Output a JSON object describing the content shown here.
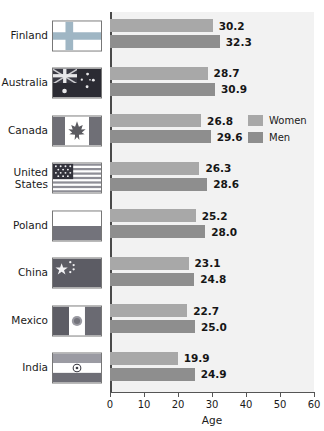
{
  "chart_data": {
    "type": "bar",
    "orientation": "horizontal",
    "title": "",
    "xlabel": "Age",
    "ylabel": "",
    "xlim": [
      0,
      60
    ],
    "xticks": [
      0,
      10,
      20,
      30,
      40,
      50,
      60
    ],
    "grid": false,
    "legend_position": "inside-right",
    "categories": [
      "Finland",
      "Australia",
      "Canada",
      "United States",
      "Poland",
      "China",
      "Mexico",
      "India"
    ],
    "series": [
      {
        "name": "Women",
        "color": "#a8a8a8",
        "values": [
          30.2,
          28.7,
          26.8,
          26.3,
          25.2,
          23.1,
          22.7,
          19.9
        ]
      },
      {
        "name": "Men",
        "color": "#8e8e8e",
        "values": [
          32.3,
          30.9,
          29.6,
          28.6,
          28.0,
          24.8,
          25.0,
          24.9
        ]
      }
    ]
  },
  "legend": {
    "items": [
      {
        "label": "Women",
        "color": "#a8a8a8"
      },
      {
        "label": "Men",
        "color": "#8e8e8e"
      }
    ]
  },
  "axis": {
    "x_title": "Age",
    "tick_labels": [
      "0",
      "10",
      "20",
      "30",
      "40",
      "50",
      "60"
    ]
  },
  "rows": [
    {
      "country": "Finland",
      "flag": "flag-finland",
      "women": "30.2",
      "men": "32.3"
    },
    {
      "country": "Australia",
      "flag": "flag-australia",
      "women": "28.7",
      "men": "30.9"
    },
    {
      "country": "Canada",
      "flag": "flag-canada",
      "women": "26.8",
      "men": "29.6"
    },
    {
      "country": "United States",
      "flag": "flag-usa",
      "women": "26.3",
      "men": "28.6"
    },
    {
      "country": "Poland",
      "flag": "flag-poland",
      "women": "25.2",
      "men": "28.0"
    },
    {
      "country": "China",
      "flag": "flag-china",
      "women": "23.1",
      "men": "24.8"
    },
    {
      "country": "Mexico",
      "flag": "flag-mexico",
      "women": "22.7",
      "men": "25.0"
    },
    {
      "country": "India",
      "flag": "flag-india",
      "women": "19.9",
      "men": "24.9"
    }
  ],
  "colors": {
    "women_bar": "#a8a8a8",
    "men_bar": "#8e8e8e",
    "plot_background": "#f2f2f2",
    "axis": "#4a4a4a",
    "text": "#1a1a1a"
  }
}
